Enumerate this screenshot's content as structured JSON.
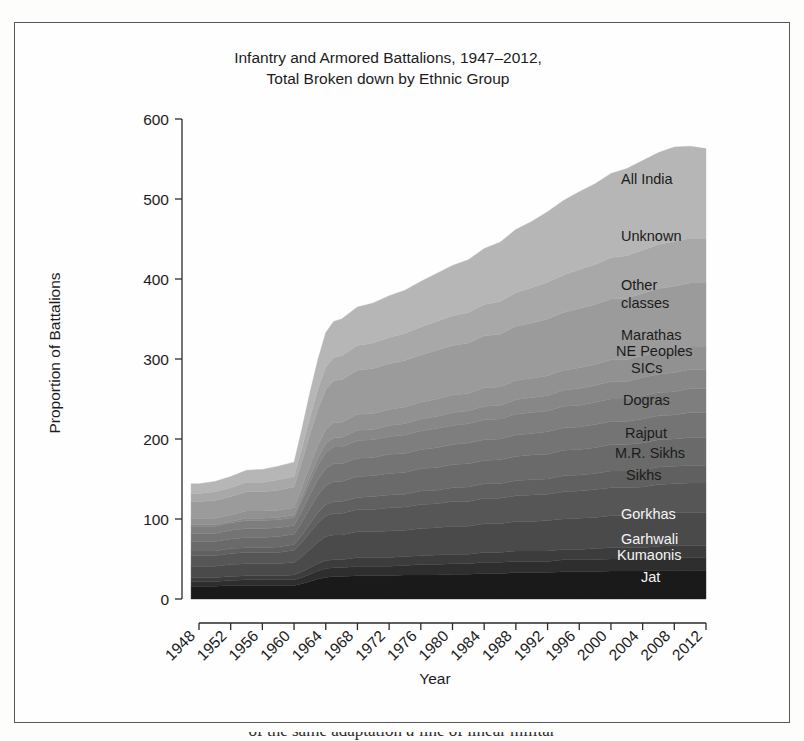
{
  "figure": {
    "title_line1": "Infantry and Armored Battalions, 1947–2012,",
    "title_line2": "Total Broken down by Ethnic Group",
    "xlabel": "Year",
    "ylabel": "Proportion of Battalions",
    "caption_fragment": "excerpt text cut off at page bottom"
  },
  "chart_data": {
    "type": "area",
    "title": "Infantry and Armored Battalions, 1947–2012, Total Broken down by Ethnic Group",
    "subtitle": "",
    "xlabel": "Year",
    "ylabel": "Proportion of Battalions",
    "xlim": [
      1947,
      2012
    ],
    "ylim": [
      0,
      600
    ],
    "ytick_values": [
      0,
      100,
      200,
      300,
      400,
      500,
      600
    ],
    "ytick_labels": [
      "0",
      "100",
      "200",
      "300",
      "400",
      "500",
      "600"
    ],
    "xtick_values": [
      1948,
      1952,
      1956,
      1960,
      1964,
      1968,
      1972,
      1976,
      1980,
      1984,
      1988,
      1992,
      1996,
      2000,
      2004,
      2008,
      2012
    ],
    "xtick_labels": [
      "1948",
      "1952",
      "1956",
      "1960",
      "1964",
      "1968",
      "1972",
      "1976",
      "1980",
      "1984",
      "1988",
      "1992",
      "1996",
      "2000",
      "2004",
      "2008",
      "2012"
    ],
    "xtick_rotation": 45,
    "grid": false,
    "legend_position": "inline-right",
    "stacked": true,
    "x": [
      1947,
      1948,
      1950,
      1952,
      1954,
      1956,
      1958,
      1960,
      1961,
      1962,
      1963,
      1964,
      1965,
      1966,
      1968,
      1970,
      1972,
      1974,
      1976,
      1978,
      1980,
      1982,
      1984,
      1986,
      1988,
      1990,
      1992,
      1994,
      1996,
      1998,
      2000,
      2002,
      2004,
      2006,
      2008,
      2010,
      2012
    ],
    "series": [
      {
        "name": "Jat",
        "color": "#1a1a1a",
        "values": [
          16,
          16,
          16,
          17,
          17,
          17,
          17,
          17,
          19,
          22,
          25,
          27,
          28,
          28,
          29,
          29,
          29,
          30,
          30,
          30,
          31,
          31,
          32,
          32,
          33,
          33,
          33,
          34,
          34,
          34,
          35,
          35,
          35,
          36,
          36,
          36,
          36
        ]
      },
      {
        "name": "Kumaonis",
        "color": "#2e2e2e",
        "values": [
          6,
          6,
          6,
          6,
          7,
          7,
          7,
          7,
          8,
          9,
          10,
          11,
          11,
          11,
          12,
          12,
          12,
          12,
          13,
          13,
          13,
          13,
          14,
          14,
          14,
          14,
          14,
          15,
          15,
          15,
          15,
          15,
          15,
          16,
          16,
          16,
          16
        ]
      },
      {
        "name": "Garhwali",
        "color": "#3c3c3c",
        "values": [
          5,
          5,
          5,
          5,
          5,
          5,
          5,
          6,
          7,
          8,
          9,
          10,
          10,
          10,
          11,
          11,
          11,
          11,
          11,
          12,
          12,
          12,
          12,
          12,
          13,
          13,
          13,
          13,
          13,
          14,
          14,
          14,
          14,
          14,
          15,
          15,
          15
        ]
      },
      {
        "name": "Gorkhas",
        "color": "#4a4a4a",
        "values": [
          14,
          14,
          14,
          15,
          15,
          15,
          15,
          16,
          19,
          23,
          27,
          30,
          31,
          31,
          32,
          32,
          33,
          33,
          34,
          34,
          35,
          35,
          36,
          36,
          37,
          37,
          38,
          38,
          39,
          39,
          40,
          40,
          40,
          41,
          41,
          41,
          41
        ]
      },
      {
        "name": "Sikhs",
        "color": "#565656",
        "values": [
          13,
          13,
          13,
          14,
          14,
          14,
          14,
          15,
          18,
          21,
          24,
          26,
          27,
          27,
          28,
          28,
          29,
          29,
          30,
          30,
          31,
          31,
          32,
          32,
          32,
          33,
          33,
          34,
          34,
          35,
          35,
          35,
          36,
          36,
          36,
          37,
          37
        ]
      },
      {
        "name": "M.R. Sikhs",
        "color": "#606060",
        "values": [
          6,
          6,
          6,
          6,
          6,
          6,
          7,
          7,
          9,
          11,
          13,
          14,
          15,
          15,
          15,
          16,
          16,
          16,
          17,
          17,
          17,
          18,
          18,
          18,
          19,
          19,
          19,
          20,
          20,
          20,
          21,
          21,
          21,
          22,
          22,
          22,
          22
        ]
      },
      {
        "name": "Rajput",
        "color": "#6a6a6a",
        "values": [
          12,
          12,
          12,
          12,
          13,
          13,
          13,
          13,
          16,
          19,
          22,
          24,
          25,
          25,
          26,
          26,
          27,
          27,
          28,
          28,
          29,
          29,
          29,
          30,
          30,
          31,
          31,
          32,
          32,
          32,
          33,
          33,
          34,
          34,
          34,
          35,
          35
        ]
      },
      {
        "name": "Dogras",
        "color": "#747474",
        "values": [
          10,
          10,
          10,
          11,
          11,
          11,
          11,
          11,
          14,
          17,
          19,
          21,
          22,
          22,
          23,
          23,
          24,
          24,
          24,
          25,
          25,
          26,
          26,
          26,
          27,
          27,
          28,
          28,
          28,
          29,
          29,
          29,
          30,
          30,
          30,
          31,
          31
        ]
      },
      {
        "name": "SICs",
        "color": "#7e7e7e",
        "values": [
          9,
          9,
          9,
          9,
          10,
          10,
          10,
          10,
          13,
          16,
          18,
          20,
          21,
          21,
          22,
          22,
          22,
          23,
          23,
          24,
          24,
          24,
          25,
          25,
          26,
          26,
          26,
          27,
          27,
          28,
          28,
          28,
          29,
          29,
          29,
          30,
          30
        ]
      },
      {
        "name": "NE Peoples",
        "color": "#878787",
        "values": [
          2,
          2,
          2,
          2,
          3,
          3,
          3,
          3,
          5,
          7,
          9,
          11,
          12,
          12,
          13,
          13,
          14,
          14,
          15,
          15,
          16,
          16,
          17,
          17,
          18,
          19,
          19,
          20,
          21,
          21,
          22,
          22,
          23,
          23,
          24,
          24,
          24
        ]
      },
      {
        "name": "Marathas",
        "color": "#919191",
        "values": [
          8,
          8,
          8,
          8,
          9,
          9,
          9,
          9,
          12,
          14,
          16,
          18,
          19,
          19,
          20,
          20,
          20,
          21,
          21,
          22,
          22,
          22,
          23,
          23,
          24,
          24,
          25,
          25,
          26,
          26,
          27,
          27,
          27,
          28,
          28,
          28,
          28
        ]
      },
      {
        "name": "Other classes",
        "color": "#9b9b9b",
        "values": [
          21,
          21,
          22,
          23,
          24,
          24,
          25,
          26,
          32,
          39,
          45,
          50,
          52,
          53,
          55,
          56,
          57,
          58,
          59,
          61,
          62,
          63,
          65,
          66,
          68,
          69,
          71,
          72,
          74,
          75,
          76,
          77,
          78,
          79,
          80,
          80,
          80
        ]
      },
      {
        "name": "Unknown",
        "color": "#a8a8a8",
        "values": [
          10,
          10,
          11,
          11,
          12,
          12,
          13,
          13,
          17,
          21,
          25,
          28,
          29,
          30,
          31,
          32,
          33,
          34,
          35,
          36,
          37,
          38,
          39,
          41,
          42,
          44,
          46,
          47,
          49,
          50,
          52,
          53,
          54,
          55,
          56,
          56,
          56
        ]
      },
      {
        "name": "All India",
        "color": "#b6b6b6",
        "values": [
          12,
          12,
          13,
          14,
          15,
          16,
          17,
          18,
          24,
          31,
          37,
          43,
          45,
          46,
          48,
          50,
          52,
          54,
          57,
          60,
          63,
          66,
          70,
          74,
          79,
          83,
          88,
          93,
          97,
          101,
          105,
          109,
          112,
          115,
          118,
          115,
          112
        ]
      }
    ],
    "series_labels": [
      {
        "name": "All India",
        "x": 620,
        "y": 183,
        "light": false
      },
      {
        "name": "Unknown",
        "x": 620,
        "y": 240,
        "light": false
      },
      {
        "name": "Other",
        "x": 620,
        "y": 289,
        "light": false
      },
      {
        "name": "classes",
        "x": 620,
        "y": 307,
        "light": false
      },
      {
        "name": "Marathas",
        "x": 620,
        "y": 339,
        "light": false
      },
      {
        "name": "NE Peoples",
        "x": 615,
        "y": 355,
        "light": false
      },
      {
        "name": "SICs",
        "x": 630,
        "y": 372,
        "light": false
      },
      {
        "name": "Dogras",
        "x": 622,
        "y": 404,
        "light": false
      },
      {
        "name": "Rajput",
        "x": 624,
        "y": 437,
        "light": false
      },
      {
        "name": "M.R. Sikhs",
        "x": 614,
        "y": 457,
        "light": false
      },
      {
        "name": "Sikhs",
        "x": 625,
        "y": 479,
        "light": false
      },
      {
        "name": "Gorkhas",
        "x": 620,
        "y": 518,
        "light": true
      },
      {
        "name": "Garhwali",
        "x": 620,
        "y": 543,
        "light": true
      },
      {
        "name": "Kumaonis",
        "x": 616,
        "y": 559,
        "light": true
      },
      {
        "name": "Jat",
        "x": 640,
        "y": 581,
        "light": true
      }
    ]
  }
}
